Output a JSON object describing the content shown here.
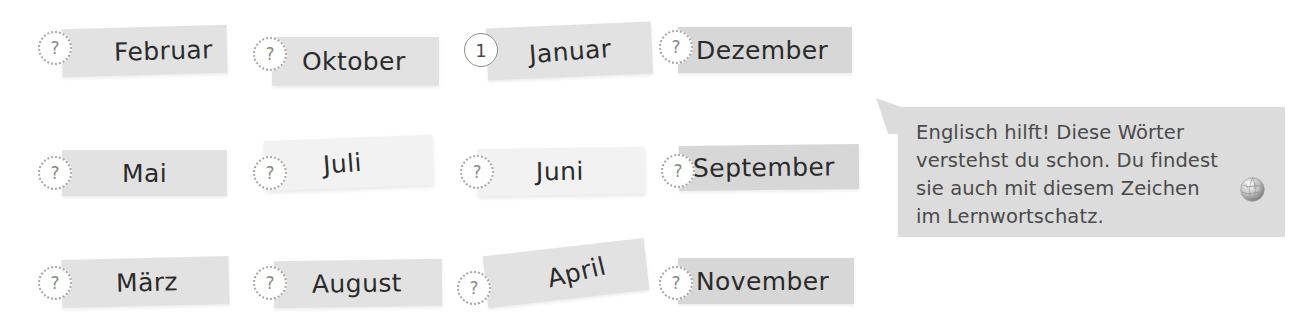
{
  "page": {
    "kind": "worksheet-exercise",
    "language": "de",
    "background_color": "#ffffff",
    "card_color": "#d7d7d7",
    "card_color_light": "#f2f2f2",
    "text_color": "#2b2b2b",
    "callout_color": "#dcdcdc",
    "callout_text_color": "#4a4a4a"
  },
  "cards": [
    {
      "word": "Februar",
      "marker": "?",
      "marker_type": "question",
      "shade": "mid",
      "rotation": "-1.6deg",
      "text_rotation": "0deg",
      "x": 62,
      "y": 27,
      "w": 165,
      "h": 48,
      "text_pad": 52,
      "marker_x": 38,
      "marker_y": 31
    },
    {
      "word": "Oktober",
      "marker": "?",
      "marker_type": "question",
      "shade": "mid",
      "rotation": "0deg",
      "text_rotation": "0deg",
      "x": 272,
      "y": 37,
      "w": 167,
      "h": 49,
      "text_pad": 30,
      "marker_x": 253,
      "marker_y": 37
    },
    {
      "word": "Januar",
      "marker": "1",
      "marker_type": "number",
      "shade": "mid",
      "rotation": "-2.4deg",
      "text_rotation": "-1.8deg",
      "x": 487,
      "y": 25,
      "w": 165,
      "h": 52,
      "text_pad": 42,
      "marker_x": 464,
      "marker_y": 33
    },
    {
      "word": "Dezember",
      "marker": "?",
      "marker_type": "question",
      "shade": "default",
      "rotation": "0deg",
      "text_rotation": "0deg",
      "x": 678,
      "y": 27,
      "w": 174,
      "h": 46,
      "text_pad": 18,
      "marker_x": 659,
      "marker_y": 30
    },
    {
      "word": "Mai",
      "marker": "?",
      "marker_type": "question",
      "shade": "mid",
      "rotation": "0deg",
      "text_rotation": "0deg",
      "x": 62,
      "y": 150,
      "w": 165,
      "h": 46,
      "text_pad": 60,
      "marker_x": 38,
      "marker_y": 156
    },
    {
      "word": "Juli",
      "marker": "?",
      "marker_type": "question",
      "shade": "light",
      "rotation": "-2.2deg",
      "text_rotation": "-2.0deg",
      "x": 265,
      "y": 138,
      "w": 168,
      "h": 50,
      "text_pad": 58,
      "marker_x": 253,
      "marker_y": 156
    },
    {
      "word": "Juni",
      "marker": "?",
      "marker_type": "question",
      "shade": "light",
      "rotation": "-0.8deg",
      "text_rotation": "0deg",
      "x": 478,
      "y": 148,
      "w": 167,
      "h": 47,
      "text_pad": 58,
      "marker_x": 460,
      "marker_y": 155
    },
    {
      "word": "September",
      "marker": "?",
      "marker_type": "question",
      "shade": "default",
      "rotation": "-0.6deg",
      "text_rotation": "0deg",
      "x": 679,
      "y": 145,
      "w": 180,
      "h": 45,
      "text_pad": 14,
      "marker_x": 661,
      "marker_y": 154
    },
    {
      "word": "März",
      "marker": "?",
      "marker_type": "question",
      "shade": "mid",
      "rotation": "-1.4deg",
      "text_rotation": "0deg",
      "x": 62,
      "y": 258,
      "w": 167,
      "h": 48,
      "text_pad": 54,
      "marker_x": 38,
      "marker_y": 266
    },
    {
      "word": "August",
      "marker": "?",
      "marker_type": "question",
      "shade": "mid",
      "rotation": "-0.8deg",
      "text_rotation": "0deg",
      "x": 274,
      "y": 260,
      "w": 168,
      "h": 47,
      "text_pad": 38,
      "marker_x": 253,
      "marker_y": 266
    },
    {
      "word": "April",
      "marker": "?",
      "marker_type": "question",
      "shade": "mid",
      "rotation": "-6.5deg",
      "text_rotation": "-7.0deg",
      "x": 485,
      "y": 247,
      "w": 162,
      "h": 52,
      "text_pad": 62,
      "marker_x": 457,
      "marker_y": 271
    },
    {
      "word": "November",
      "marker": "?",
      "marker_type": "question",
      "shade": "default",
      "rotation": "0deg",
      "text_rotation": "0deg",
      "x": 678,
      "y": 258,
      "w": 176,
      "h": 46,
      "text_pad": 18,
      "marker_x": 659,
      "marker_y": 266
    }
  ],
  "callout": {
    "text": "Englisch hilft! Diese Wörter\nverstehst du schon. Du findest\nsie auch mit diesem Zeichen\nim Lernwortschatz.",
    "icon": "globe-icon"
  }
}
